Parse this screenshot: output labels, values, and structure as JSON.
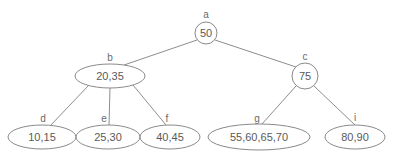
{
  "diagram": {
    "type": "tree",
    "stroke_color": "#8a8a8a",
    "text_color": "#5a5a5a",
    "background_color": "#ffffff",
    "nodes": [
      {
        "id": "a",
        "key_label": "a",
        "value": "50",
        "shape": "circle",
        "cx": 206,
        "cy": 33,
        "rx": 11,
        "ry": 11,
        "key_x": 206,
        "key_y": 18,
        "level": 0
      },
      {
        "id": "b",
        "key_label": "b",
        "value": "20,35",
        "shape": "ellipse",
        "cx": 110,
        "cy": 76,
        "rx": 35,
        "ry": 12,
        "key_x": 110,
        "key_y": 61,
        "level": 1
      },
      {
        "id": "c",
        "key_label": "c",
        "value": "75",
        "shape": "circle",
        "cx": 305,
        "cy": 76,
        "rx": 13,
        "ry": 13,
        "key_x": 305,
        "key_y": 60,
        "level": 1
      },
      {
        "id": "d",
        "key_label": "d",
        "value": "10,15",
        "shape": "ellipse",
        "cx": 42,
        "cy": 137,
        "rx": 34,
        "ry": 12,
        "key_x": 43,
        "key_y": 122,
        "level": 2
      },
      {
        "id": "e",
        "key_label": "e",
        "value": "25,30",
        "shape": "ellipse",
        "cx": 108,
        "cy": 137,
        "rx": 32,
        "ry": 12,
        "key_x": 104,
        "key_y": 122,
        "level": 2
      },
      {
        "id": "f",
        "key_label": "f",
        "value": "40,45",
        "shape": "ellipse",
        "cx": 170,
        "cy": 137,
        "rx": 30,
        "ry": 12,
        "key_x": 167,
        "key_y": 122,
        "level": 2
      },
      {
        "id": "g",
        "key_label": "g",
        "value": "55,60,65,70",
        "shape": "ellipse",
        "cx": 259,
        "cy": 137,
        "rx": 51,
        "ry": 13,
        "key_x": 257,
        "key_y": 122,
        "level": 2
      },
      {
        "id": "i",
        "key_label": "i",
        "value": "80,90",
        "shape": "ellipse",
        "cx": 355,
        "cy": 137,
        "rx": 30,
        "ry": 12,
        "key_x": 355,
        "key_y": 121,
        "level": 2
      }
    ],
    "edges": [
      {
        "id": "a-b",
        "from": "a",
        "to": "b",
        "x1": 197,
        "y1": 40,
        "x2": 124,
        "y2": 65
      },
      {
        "id": "a-c",
        "from": "a",
        "to": "c",
        "x1": 215,
        "y1": 40,
        "x2": 296,
        "y2": 67
      },
      {
        "id": "b-d",
        "from": "b",
        "to": "d",
        "x1": 89,
        "y1": 85,
        "x2": 50,
        "y2": 126
      },
      {
        "id": "b-e",
        "from": "b",
        "to": "e",
        "x1": 110,
        "y1": 88,
        "x2": 109,
        "y2": 125
      },
      {
        "id": "b-f",
        "from": "b",
        "to": "f",
        "x1": 133,
        "y1": 85,
        "x2": 166,
        "y2": 125
      },
      {
        "id": "c-g",
        "from": "c",
        "to": "g",
        "x1": 296,
        "y1": 86,
        "x2": 262,
        "y2": 124
      },
      {
        "id": "c-i",
        "from": "c",
        "to": "i",
        "x1": 314,
        "y1": 86,
        "x2": 355,
        "y2": 125
      }
    ]
  }
}
